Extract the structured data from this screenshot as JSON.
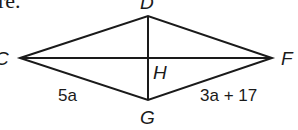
{
  "cropped_text": "re.",
  "figure": {
    "shape": "rhombus",
    "vertices": [
      {
        "name": "C",
        "x": 20,
        "y": 58
      },
      {
        "name": "D",
        "x": 148,
        "y": 16
      },
      {
        "name": "F",
        "x": 272,
        "y": 58
      },
      {
        "name": "G",
        "x": 148,
        "y": 100
      }
    ],
    "intersection": {
      "name": "H",
      "x": 148,
      "y": 58
    },
    "side_labels": [
      {
        "side": "CG",
        "text": "5a"
      },
      {
        "side": "GF",
        "text": "3a + 17"
      }
    ],
    "colors": {
      "stroke": "#1a1a1a",
      "background": "#ffffff"
    }
  }
}
